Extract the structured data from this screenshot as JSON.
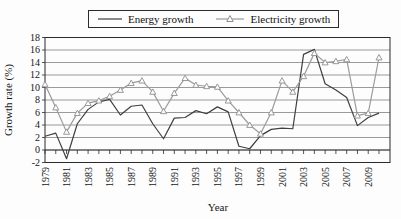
{
  "figure": {
    "legend": [
      {
        "label": "Energy growth"
      },
      {
        "label": "Electricity growth"
      }
    ],
    "ylabel": "Growth rate (%)",
    "xlabel": "Year"
  },
  "chart_data": {
    "type": "line",
    "x": [
      1979,
      1980,
      1981,
      1982,
      1983,
      1984,
      1985,
      1986,
      1987,
      1988,
      1989,
      1990,
      1991,
      1992,
      1993,
      1994,
      1995,
      1996,
      1997,
      1998,
      1999,
      2000,
      2001,
      2002,
      2003,
      2004,
      2005,
      2006,
      2007,
      2008,
      2009,
      2010
    ],
    "series": [
      {
        "name": "Energy growth",
        "color": "#3f3f3f",
        "marker": "none",
        "values": [
          2.2,
          2.7,
          -1.4,
          4.2,
          6.5,
          7.7,
          8.1,
          5.6,
          7.0,
          7.2,
          4.2,
          1.8,
          5.1,
          5.2,
          6.3,
          5.8,
          6.9,
          6.1,
          0.6,
          0.2,
          2.3,
          3.3,
          3.5,
          3.4,
          15.3,
          16.1,
          10.6,
          9.6,
          8.4,
          3.9,
          5.2,
          5.9
        ]
      },
      {
        "name": "Electricity growth",
        "color": "#9c9c9c",
        "marker": "triangle",
        "values": [
          10.5,
          6.8,
          2.9,
          5.9,
          7.5,
          7.9,
          8.6,
          9.6,
          10.7,
          11.1,
          9.3,
          6.2,
          9.1,
          11.5,
          10.4,
          10.2,
          10.1,
          7.9,
          6.0,
          4.0,
          2.6,
          6.0,
          11.1,
          9.3,
          11.8,
          15.5,
          14.0,
          14.2,
          14.5,
          5.5,
          5.9,
          14.8
        ]
      }
    ],
    "title": "",
    "xlabel": "Year",
    "ylabel": "Growth rate (%)",
    "ylim": [
      -2,
      18
    ],
    "yticks": [
      -2,
      0,
      2,
      4,
      6,
      8,
      10,
      12,
      14,
      16,
      18
    ],
    "xtick_labels": [
      "1979",
      "1981",
      "1983",
      "1985",
      "1987",
      "1989",
      "1991",
      "1993",
      "1995",
      "1997",
      "1999",
      "2001",
      "2003",
      "2005",
      "2007",
      "2009"
    ],
    "grid": "horizontal",
    "legend_position": "top-center",
    "axis_crossing_y": 0
  }
}
